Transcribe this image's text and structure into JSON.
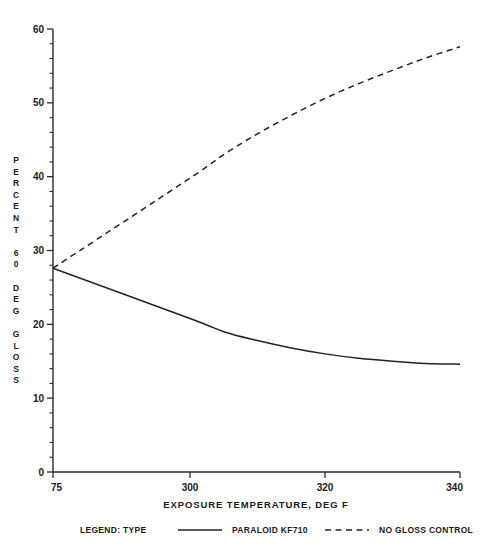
{
  "chart_data": {
    "type": "line",
    "title": "",
    "xlabel": "EXPOSURE  TEMPERATURE,  DEG F",
    "ylabel": "PERCENT 60 DEG GLOSS",
    "ylabel_chars": [
      "P",
      "E",
      "R",
      "C",
      "E",
      "N",
      "T",
      "",
      "6",
      "0",
      "",
      "D",
      "E",
      "G",
      "",
      "G",
      "L",
      "O",
      "S",
      "S"
    ],
    "xlim": [
      75,
      340
    ],
    "ylim": [
      0,
      60
    ],
    "x_ticks": [
      75,
      300,
      320,
      340
    ],
    "x_tick_labels": [
      "75",
      "300",
      "320",
      "340"
    ],
    "y_ticks": [
      0,
      10,
      20,
      30,
      40,
      50,
      60
    ],
    "y_tick_labels": [
      "0",
      "10",
      "20",
      "30",
      "40",
      "50",
      "60"
    ],
    "y_minor_step": 2,
    "grid": false,
    "legend_position": "below",
    "legend_title": "LEGEND: TYPE",
    "series": [
      {
        "name": "PARALOID KF710",
        "style": "solid",
        "color": "#232323",
        "x": [
          75,
          300,
          305,
          310,
          315,
          320,
          325,
          330,
          335,
          340
        ],
        "y": [
          27.6,
          20.8,
          19.0,
          17.8,
          16.8,
          16.0,
          15.4,
          15.0,
          14.7,
          14.6
        ]
      },
      {
        "name": "NO GLOSS CONTROL",
        "style": "dashed",
        "color": "#232323",
        "x": [
          75,
          300,
          305,
          310,
          315,
          320,
          325,
          330,
          335,
          340
        ],
        "y": [
          27.6,
          39.8,
          43.0,
          45.8,
          48.3,
          50.6,
          52.6,
          54.4,
          56.1,
          57.6
        ]
      }
    ]
  },
  "legend": {
    "title": "LEGEND: TYPE",
    "entries": [
      {
        "label": "PARALOID KF710",
        "style": "solid"
      },
      {
        "label": "NO GLOSS CONTROL",
        "style": "dashed"
      }
    ]
  },
  "colors": {
    "background": "#ffffff",
    "ink": "#1a1a1a",
    "series": "#232323"
  }
}
